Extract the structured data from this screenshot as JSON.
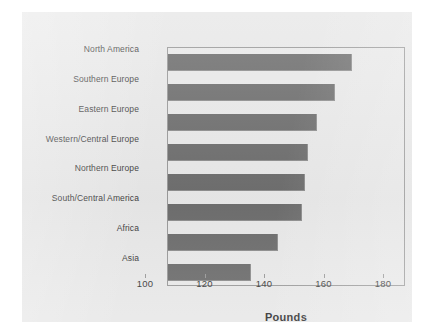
{
  "chart_data": {
    "type": "bar",
    "orientation": "horizontal",
    "title": "",
    "xlabel": "Pounds",
    "ylabel": "",
    "xlim": [
      100,
      180
    ],
    "xticks": [
      100,
      120,
      140,
      160,
      180
    ],
    "xtick_labels": [
      "100",
      "120",
      "140",
      "160",
      "180"
    ],
    "grid": false,
    "legend": null,
    "categories": [
      "North America",
      "Southern Europe",
      "Eastern Europe",
      "Western/Central Europe",
      "Northern Europe",
      "South/Central America",
      "Africa",
      "Asia"
    ],
    "values": [
      162,
      156,
      150,
      147,
      146,
      145,
      137,
      128
    ],
    "bar_color": "#6e6e6e",
    "plot_background": "#e9e9e9",
    "figure_background": "#e8e8e8",
    "axis_color": "#9a9a9a",
    "text_color": "#3b3b3b"
  }
}
